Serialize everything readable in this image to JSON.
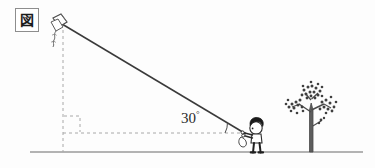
{
  "figure": {
    "label": "図",
    "label_box_name": "figure-number-box"
  },
  "annotations": {
    "angle_value": "30",
    "angle_unit": "°",
    "angle_label": "30°"
  },
  "colors": {
    "ink": "#2a2a2a",
    "line": "#3a3a3a",
    "dashed": "#a8a8a8",
    "ground": "#6b6b6b",
    "box_border": "#8d8d8d",
    "paper": "#fdfdfd",
    "hair": "#1a1a1a",
    "tree": "#4a4a4a"
  },
  "geometry": {
    "ground_y": 152,
    "ground_x_start": 30,
    "ground_x_end": 363,
    "kite_anchor_x": 63,
    "kite_anchor_y": 25,
    "hand_x": 245,
    "hand_y": 133,
    "horizontal_dash_y": 133,
    "vertical_dash_x": 63,
    "right_angle_marker": "64,112 to 80,128"
  },
  "elements": {
    "kite_name": "kite",
    "kite_tail_name": "kite-tail",
    "string_name": "kite-string-line",
    "vertical_dashed_name": "vertical-height-dashed-line",
    "horizontal_dashed_name": "horizontal-distance-dashed-line",
    "right_angle_name": "right-angle-marker",
    "arc_name": "angle-arc",
    "ground_name": "ground-line",
    "child_name": "child-flying-kite",
    "reel_name": "kite-reel",
    "tree_name": "tree"
  }
}
